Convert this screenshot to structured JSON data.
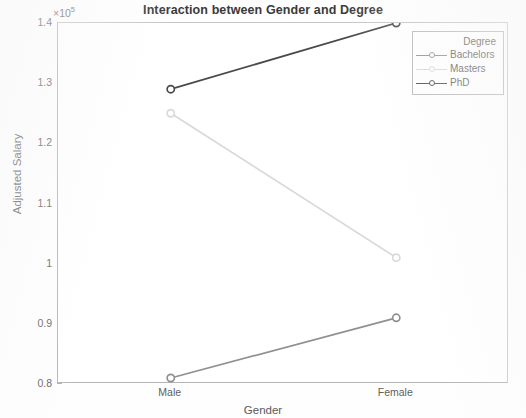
{
  "figure": {
    "width": 526,
    "height": 418,
    "background": "#fefefe"
  },
  "chart_data": {
    "type": "line",
    "title": "Interaction between Gender and Degree",
    "xlabel": "Gender",
    "ylabel": "Adjusted Salary",
    "categories": [
      "Male",
      "Female"
    ],
    "exponent_label": "×10",
    "exponent_power": "5",
    "y_scale_factor": 100000,
    "ylim": [
      80000,
      140000
    ],
    "yticks": [
      80000,
      90000,
      100000,
      110000,
      120000,
      130000,
      140000
    ],
    "ytick_labels": [
      "0.8",
      "0.9",
      "1",
      "1.1",
      "1.2",
      "1.3",
      "1.4"
    ],
    "xlim": [
      0,
      1
    ],
    "grid": false,
    "legend": {
      "title": "Degree",
      "position": "top-right"
    },
    "series": [
      {
        "name": "Bachelors",
        "values": [
          81000,
          91000
        ],
        "color": "#909090",
        "marker": "o"
      },
      {
        "name": "Masters",
        "values": [
          125000,
          101000
        ],
        "color": "#d9d9d9",
        "marker": "o"
      },
      {
        "name": "PhD",
        "values": [
          129000,
          140000
        ],
        "color": "#4a4a4a",
        "marker": "o"
      }
    ]
  },
  "axis_colors": {
    "frame": "#b4b4b4",
    "tick": "#b0b0b0",
    "tick_text": "#616161",
    "label_text": "#595959",
    "title_text": "#3a3a3a"
  }
}
